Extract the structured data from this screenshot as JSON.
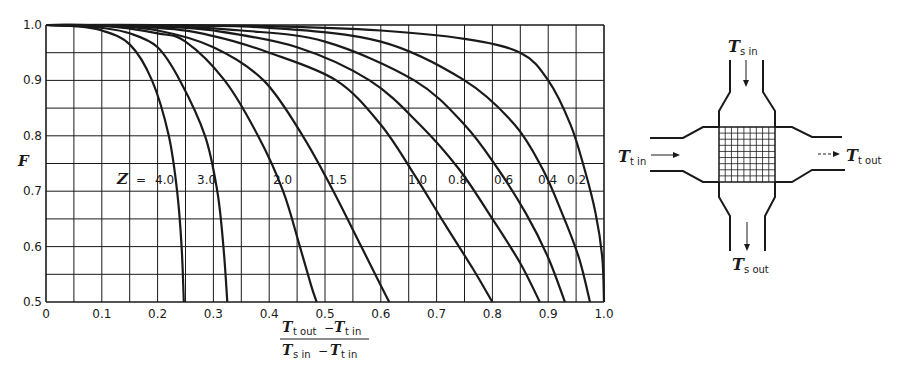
{
  "chart_data": {
    "type": "line",
    "title": "",
    "xlabel": "(T_t out − T_t in) / (T_s in − T_t in)",
    "ylabel": "F",
    "xlim": [
      0,
      1.0
    ],
    "ylim": [
      0.5,
      1.0
    ],
    "grid": true,
    "grid_step_x": 0.05,
    "grid_step_y": 0.05,
    "x_ticks": [
      "0",
      "0.1",
      "0.2",
      "0.3",
      "0.4",
      "0.5",
      "0.6",
      "0.7",
      "0.8",
      "0.9",
      "1.0"
    ],
    "y_ticks": [
      "0.5",
      "0.6",
      "0.7",
      "0.8",
      "0.9",
      "1.0"
    ],
    "legend_prefix": "Z =",
    "series": [
      {
        "name": "4.0",
        "x": [
          0,
          0.05,
          0.1,
          0.15,
          0.19,
          0.22,
          0.235,
          0.243,
          0.247
        ],
        "y": [
          1.0,
          0.998,
          0.99,
          0.965,
          0.9,
          0.8,
          0.7,
          0.6,
          0.5
        ]
      },
      {
        "name": "3.0",
        "x": [
          0,
          0.05,
          0.1,
          0.15,
          0.2,
          0.24,
          0.285,
          0.307,
          0.318,
          0.325
        ],
        "y": [
          1.0,
          0.999,
          0.995,
          0.985,
          0.96,
          0.9,
          0.8,
          0.7,
          0.6,
          0.5
        ]
      },
      {
        "name": "2.0",
        "x": [
          0,
          0.1,
          0.2,
          0.25,
          0.32,
          0.38,
          0.425,
          0.455,
          0.475,
          0.485
        ],
        "y": [
          1.0,
          0.999,
          0.985,
          0.97,
          0.9,
          0.8,
          0.7,
          0.6,
          0.53,
          0.5
        ]
      },
      {
        "name": "1.5",
        "x": [
          0,
          0.1,
          0.2,
          0.3,
          0.39,
          0.46,
          0.515,
          0.565,
          0.6,
          0.615
        ],
        "y": [
          1.0,
          0.999,
          0.99,
          0.96,
          0.9,
          0.8,
          0.7,
          0.6,
          0.53,
          0.5
        ]
      },
      {
        "name": "1.0",
        "x": [
          0,
          0.2,
          0.3,
          0.4,
          0.52,
          0.6,
          0.66,
          0.715,
          0.765,
          0.8
        ],
        "y": [
          1.0,
          0.995,
          0.98,
          0.95,
          0.9,
          0.82,
          0.73,
          0.64,
          0.56,
          0.5
        ]
      },
      {
        "name": "0.8",
        "x": [
          0,
          0.2,
          0.3,
          0.45,
          0.58,
          0.67,
          0.74,
          0.8,
          0.85,
          0.885
        ],
        "y": [
          1.0,
          0.997,
          0.99,
          0.96,
          0.9,
          0.82,
          0.74,
          0.65,
          0.57,
          0.5
        ]
      },
      {
        "name": "0.6",
        "x": [
          0,
          0.2,
          0.35,
          0.5,
          0.66,
          0.75,
          0.81,
          0.86,
          0.9,
          0.93
        ],
        "y": [
          1.0,
          0.998,
          0.99,
          0.97,
          0.9,
          0.82,
          0.74,
          0.66,
          0.58,
          0.5
        ]
      },
      {
        "name": "0.4",
        "x": [
          0,
          0.2,
          0.4,
          0.6,
          0.75,
          0.84,
          0.89,
          0.925,
          0.955,
          0.975
        ],
        "y": [
          1.0,
          0.999,
          0.995,
          0.97,
          0.9,
          0.82,
          0.74,
          0.66,
          0.58,
          0.5
        ]
      },
      {
        "name": "0.2",
        "x": [
          0,
          0.2,
          0.4,
          0.6,
          0.75,
          0.85,
          0.9,
          0.94,
          0.965,
          0.985,
          0.997,
          1.0
        ],
        "y": [
          1.0,
          1.0,
          0.998,
          0.99,
          0.975,
          0.95,
          0.9,
          0.82,
          0.74,
          0.66,
          0.58,
          0.5
        ]
      }
    ]
  },
  "axes": {
    "ylabel": "F",
    "xlabel_numerator": {
      "t": "T",
      "sub1": "t out",
      "op": "−",
      "t2": "T",
      "sub2": "t in"
    },
    "xlabel_denominator": {
      "t": "T",
      "sub1": "s in",
      "op": "−",
      "t2": "T",
      "sub2": "t in"
    },
    "z_prefix": "Z",
    "z_eq": "="
  },
  "diagram": {
    "ts_in": {
      "t": "T",
      "sub": "s in"
    },
    "ts_out": {
      "t": "T",
      "sub": "s out"
    },
    "tt_in": {
      "t": "T",
      "sub": "t in"
    },
    "tt_out": {
      "t": "T",
      "sub": "t out"
    }
  },
  "colors": {
    "ink": "#1a1a1a",
    "background": "#ffffff"
  }
}
